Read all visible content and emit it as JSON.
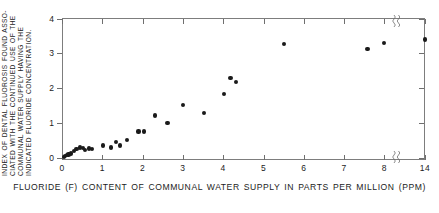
{
  "chart_data": {
    "type": "scatter",
    "title": "",
    "xlabel": "FLUORIDE (F) CONTENT OF COMMUNAL WATER SUPPLY IN PARTS PER MILLION (PPM)",
    "ylabel": "INDEX OF DENTAL FLUOROSIS FOUND ASSOCIATED WITH THE CONTINUED USE OF THE COMMUNAL WATER SUPPLY HAVING THE INDICATED FLUORIDE CONCENTRATION.",
    "ylabel_lines": [
      "INDEX OF DENTAL FLUOROSIS FOUND ASSO-",
      "CIATED WITH THE CONTINUED USE OF THE",
      "COMMUNAL WATER SUPPLY HAVING THE",
      "INDICATED FLUORIDE CONCENTRATION."
    ],
    "xlim": [
      0,
      14
    ],
    "ylim": [
      0,
      4
    ],
    "xticks": [
      0,
      1,
      2,
      3,
      4,
      5,
      6,
      7,
      8,
      14
    ],
    "xticklabels": [
      "0",
      "1",
      "2",
      "3",
      "4",
      "5",
      "6",
      "7",
      "8",
      "14"
    ],
    "yticks": [
      0,
      1,
      2,
      3,
      4
    ],
    "yticklabels": [
      "0",
      "1",
      "2",
      "3",
      "4"
    ],
    "axis_break": {
      "present": true,
      "between": [
        8,
        14
      ],
      "style": "squiggle"
    },
    "grid": false,
    "legend": false,
    "marker": "filled-circle",
    "marker_color": "#1a1a1a",
    "points": [
      {
        "x": 0.04,
        "y": 0.04
      },
      {
        "x": 0.08,
        "y": 0.06
      },
      {
        "x": 0.12,
        "y": 0.08
      },
      {
        "x": 0.16,
        "y": 0.1
      },
      {
        "x": 0.22,
        "y": 0.13
      },
      {
        "x": 0.3,
        "y": 0.19
      },
      {
        "x": 0.36,
        "y": 0.26
      },
      {
        "x": 0.45,
        "y": 0.3
      },
      {
        "x": 0.52,
        "y": 0.29
      },
      {
        "x": 0.58,
        "y": 0.24
      },
      {
        "x": 0.66,
        "y": 0.27
      },
      {
        "x": 0.74,
        "y": 0.25
      },
      {
        "x": 1.02,
        "y": 0.36
      },
      {
        "x": 1.22,
        "y": 0.3
      },
      {
        "x": 1.34,
        "y": 0.47
      },
      {
        "x": 1.44,
        "y": 0.36
      },
      {
        "x": 1.62,
        "y": 0.52
      },
      {
        "x": 1.9,
        "y": 0.76
      },
      {
        "x": 2.04,
        "y": 0.76
      },
      {
        "x": 2.3,
        "y": 1.22
      },
      {
        "x": 2.62,
        "y": 1.0
      },
      {
        "x": 3.0,
        "y": 1.52
      },
      {
        "x": 3.52,
        "y": 1.3
      },
      {
        "x": 4.02,
        "y": 1.84
      },
      {
        "x": 4.18,
        "y": 2.3
      },
      {
        "x": 4.32,
        "y": 2.18
      },
      {
        "x": 5.5,
        "y": 3.26
      },
      {
        "x": 7.58,
        "y": 3.12
      },
      {
        "x": 8.0,
        "y": 3.3
      },
      {
        "x": 14.0,
        "y": 3.4
      }
    ]
  }
}
